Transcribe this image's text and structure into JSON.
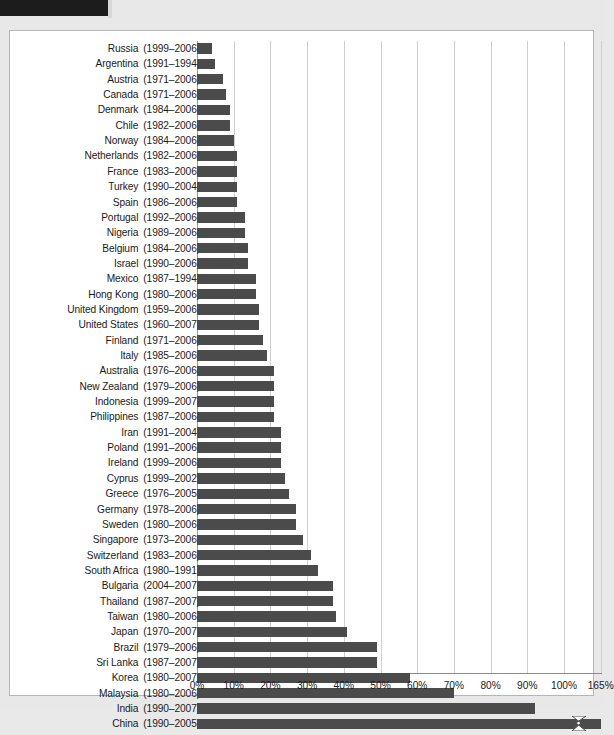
{
  "page": {
    "background_color": "#e8e8e8",
    "header_block_color": "#1c1c1c"
  },
  "figure": {
    "frame_color": "#b6b6b6",
    "plot_background": "#ffffff",
    "bar_color": "#4b4b4b",
    "gridline_color": "#cfcfcf"
  },
  "chart_data": {
    "type": "bar",
    "orientation": "horizontal",
    "title": "",
    "subtitle": "",
    "xlabel": "",
    "ylabel": "",
    "grid": true,
    "legend": null,
    "axis_break": {
      "present": true,
      "after_tick": "100%",
      "final_tick": "165%",
      "marker": "zigzag"
    },
    "xlim": [
      0,
      100
    ],
    "xtick_labels": [
      "0%",
      "10%",
      "20%",
      "30%",
      "40%",
      "50%",
      "60%",
      "70%",
      "80%",
      "90%",
      "100%",
      "165%"
    ],
    "xtick_values": [
      0,
      10,
      20,
      30,
      40,
      50,
      60,
      70,
      80,
      90,
      100,
      110
    ],
    "categories": [
      "Russia",
      "Argentina",
      "Austria",
      "Canada",
      "Denmark",
      "Chile",
      "Norway",
      "Netherlands",
      "France",
      "Turkey",
      "Spain",
      "Portugal",
      "Nigeria",
      "Belgium",
      "Israel",
      "Mexico",
      "Hong Kong",
      "United Kingdom",
      "United States",
      "Finland",
      "Italy",
      "Australia",
      "New Zealand",
      "Indonesia",
      "Philippines",
      "Iran",
      "Poland",
      "Ireland",
      "Cyprus",
      "Greece",
      "Germany",
      "Sweden",
      "Singapore",
      "Switzerland",
      "South Africa",
      "Bulgaria",
      "Thailand",
      "Taiwan",
      "Japan",
      "Brazil",
      "Sri Lanka",
      "Korea",
      "Malaysia",
      "India",
      "China"
    ],
    "year_ranges": [
      "(1999–2006)",
      "(1991–1994)",
      "(1971–2006)",
      "(1971–2006)",
      "(1984–2006)",
      "(1982–2006)",
      "(1984–2006)",
      "(1982–2006)",
      "(1983–2006)",
      "(1990–2004)",
      "(1986–2006)",
      "(1992–2006)",
      "(1989–2006)",
      "(1984–2006)",
      "(1990–2006)",
      "(1987–1994)",
      "(1980–2006)",
      "(1959–2006)",
      "(1960–2007)",
      "(1971–2006)",
      "(1985–2006)",
      "(1976–2006)",
      "(1979–2006)",
      "(1999–2007)",
      "(1987–2006)",
      "(1991–2004)",
      "(1991–2006)",
      "(1999–2006)",
      "(1999–2002)",
      "(1976–2005)",
      "(1978–2006)",
      "(1980–2006)",
      "(1973–2006)",
      "(1983–2006)",
      "(1980–1991)",
      "(2004–2007)",
      "(1987–2007)",
      "(1980–2006)",
      "(1970–2007)",
      "(1979–2006)",
      "(1987–2007)",
      "(1980–2007)",
      "(1980–2006)",
      "(1990–2007)",
      "(1990–2005)"
    ],
    "values": [
      4,
      5,
      7,
      8,
      9,
      9,
      10,
      11,
      11,
      11,
      11,
      13,
      13,
      14,
      14,
      16,
      16,
      17,
      17,
      18,
      19,
      21,
      21,
      21,
      21,
      23,
      23,
      23,
      24,
      25,
      27,
      27,
      29,
      31,
      33,
      37,
      37,
      38,
      41,
      49,
      49,
      58,
      70,
      92,
      165
    ],
    "value_unit": "%",
    "bar_count": 45
  }
}
